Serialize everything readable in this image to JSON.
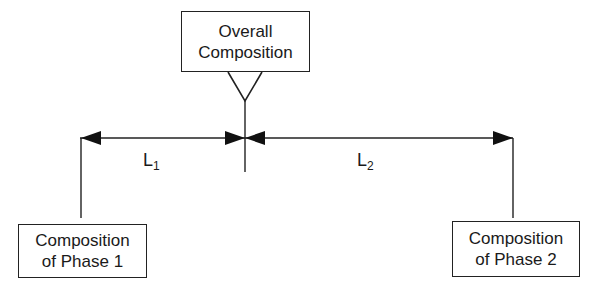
{
  "diagram": {
    "type": "lever-rule",
    "top_box": {
      "line1": "Overall",
      "line2": "Composition"
    },
    "left_box": {
      "line1": "Composition",
      "line2": "of Phase 1"
    },
    "right_box": {
      "line1": "Composition",
      "line2": "of Phase 2"
    },
    "segments": [
      {
        "letter": "L",
        "subscript": "1"
      },
      {
        "letter": "L",
        "subscript": "2"
      }
    ],
    "colors": {
      "line": "#222222",
      "background": "#ffffff"
    }
  }
}
